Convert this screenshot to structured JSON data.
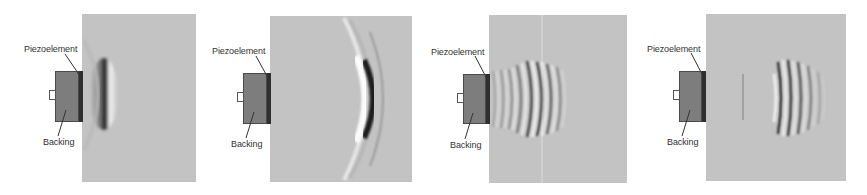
{
  "figure": {
    "background_color": "#ffffff",
    "field_color": "#c3c3c3",
    "backing_color": "#7d7d7d",
    "piezo_color": "#2f2f2f"
  },
  "panels": [
    {
      "id": "panel-1",
      "labels": {
        "piezo": "Piezoelement",
        "backing": "Backing"
      },
      "field": {
        "x": 82,
        "y": 14,
        "w": 114,
        "h": 168
      },
      "backing_box": {
        "x": 55,
        "y": 71,
        "w": 24,
        "h": 51
      },
      "piezo_box": {
        "x": 79,
        "y": 71,
        "w": 4,
        "h": 51
      },
      "connector": {
        "x": 49,
        "y": 90,
        "w": 7,
        "h": 10
      },
      "piezo_label_pos": {
        "x": 24,
        "y": 44
      },
      "backing_label_pos": {
        "x": 43,
        "y": 137
      },
      "wave": "single-pulse near source"
    },
    {
      "id": "panel-2",
      "labels": {
        "piezo": "Piezoelement",
        "backing": "Backing"
      },
      "field": {
        "x": 270,
        "y": 16,
        "w": 142,
        "h": 166
      },
      "backing_box": {
        "x": 243,
        "y": 73,
        "w": 24,
        "h": 51
      },
      "piezo_box": {
        "x": 267,
        "y": 73,
        "w": 4,
        "h": 51
      },
      "connector": {
        "x": 237,
        "y": 92,
        "w": 7,
        "h": 10
      },
      "piezo_label_pos": {
        "x": 212,
        "y": 46
      },
      "backing_label_pos": {
        "x": 231,
        "y": 139
      },
      "wave": "single-pulse propagated far"
    },
    {
      "id": "panel-3",
      "labels": {
        "piezo": "Piezoelement",
        "backing": "Backing"
      },
      "field": {
        "x": 489,
        "y": 15,
        "w": 138,
        "h": 168
      },
      "backing_box": {
        "x": 463,
        "y": 74,
        "w": 23,
        "h": 50
      },
      "piezo_box": {
        "x": 486,
        "y": 74,
        "w": 4,
        "h": 50
      },
      "connector": {
        "x": 457,
        "y": 93,
        "w": 7,
        "h": 10
      },
      "piezo_label_pos": {
        "x": 431,
        "y": 47
      },
      "backing_label_pos": {
        "x": 450,
        "y": 140
      },
      "wave": "multi-cycle burst near source"
    },
    {
      "id": "panel-4",
      "labels": {
        "piezo": "Piezoelement",
        "backing": "Backing"
      },
      "field": {
        "x": 706,
        "y": 14,
        "w": 140,
        "h": 167
      },
      "backing_box": {
        "x": 679,
        "y": 71,
        "w": 23,
        "h": 51
      },
      "piezo_box": {
        "x": 702,
        "y": 71,
        "w": 4,
        "h": 51
      },
      "connector": {
        "x": 673,
        "y": 90,
        "w": 7,
        "h": 10
      },
      "piezo_label_pos": {
        "x": 647,
        "y": 44
      },
      "backing_label_pos": {
        "x": 667,
        "y": 137
      },
      "wave": "multi-cycle burst propagated far"
    }
  ]
}
